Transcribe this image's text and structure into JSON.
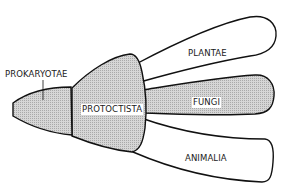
{
  "diagram": {
    "type": "five-kingdom classification tree",
    "colors": {
      "stroke": "#111111",
      "shaded_fill": "#c8c8c8",
      "unshaded_fill": "#ffffff",
      "background": "#ffffff"
    },
    "nodes": [
      {
        "id": "prokaryotae",
        "label": "PROKARYOTAE",
        "shaded": true
      },
      {
        "id": "protoctista",
        "label": "PROTOCTISTA",
        "shaded": true
      },
      {
        "id": "plantae",
        "label": "PLANTAE",
        "shaded": false
      },
      {
        "id": "fungi",
        "label": "FUNGI",
        "shaded": true
      },
      {
        "id": "animalia",
        "label": "ANIMALIA",
        "shaded": false
      }
    ],
    "edges": [
      {
        "from": "prokaryotae",
        "to": "protoctista"
      },
      {
        "from": "protoctista",
        "to": "plantae"
      },
      {
        "from": "protoctista",
        "to": "fungi"
      },
      {
        "from": "protoctista",
        "to": "animalia"
      }
    ]
  }
}
